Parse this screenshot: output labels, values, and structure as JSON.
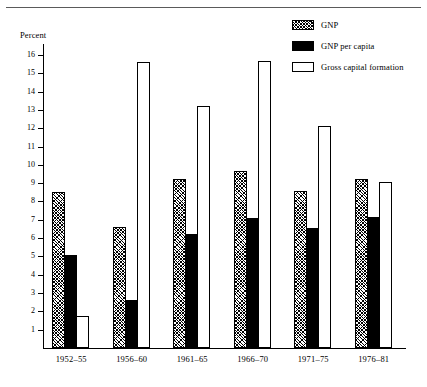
{
  "chart_data": {
    "type": "bar",
    "title": "",
    "subtitle": "",
    "xlabel": "",
    "ylabel": "Percent",
    "ylim": [
      0,
      16.6
    ],
    "yticks": [
      1,
      2,
      3,
      4,
      5,
      6,
      7,
      8,
      9,
      10,
      11,
      12,
      13,
      14,
      15,
      16
    ],
    "ytick_labels": [
      "1",
      "2",
      "3",
      "4",
      "5",
      "6",
      "7",
      "8",
      "9",
      "10",
      "11",
      "12",
      "13",
      "14",
      "15",
      "16"
    ],
    "grid": false,
    "legend_position": "top-right",
    "categories": [
      "1952–55",
      "1956–60",
      "1961–65",
      "1966–70",
      "1971–75",
      "1976–81"
    ],
    "series": [
      {
        "name": "GNP",
        "style": "hatched",
        "values": [
          8.5,
          6.6,
          9.25,
          9.65,
          8.55,
          9.25
        ]
      },
      {
        "name": "GNP per capita",
        "style": "solid-black",
        "values": [
          5.1,
          2.6,
          6.25,
          7.1,
          6.55,
          7.15
        ]
      },
      {
        "name": "Gross capital formation",
        "style": "open-white",
        "values": [
          1.75,
          15.6,
          13.2,
          15.65,
          12.1,
          9.05
        ]
      }
    ]
  },
  "legend": {
    "items": [
      {
        "label": "GNP",
        "swatch": "hatched-swatch-icon"
      },
      {
        "label": "GNP per capita",
        "swatch": "black-swatch-icon"
      },
      {
        "label": "Gross capital formation",
        "swatch": "white-swatch-icon"
      }
    ]
  },
  "axes": {
    "y_title": "Percent"
  }
}
